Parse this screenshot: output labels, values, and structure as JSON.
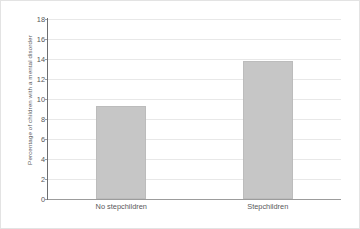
{
  "chart_data": {
    "type": "bar",
    "title": "",
    "subtitle": "",
    "xlabel": "",
    "ylabel": "Percentage of children with a mental disorder",
    "categories": [
      "No stepchildren",
      "Stepchildren"
    ],
    "values": [
      9.35,
      13.8
    ],
    "ylim": [
      0,
      18
    ],
    "ytick_labels": [
      "0",
      "2",
      "4",
      "6",
      "8",
      "10",
      "12",
      "14",
      "16",
      "18"
    ],
    "ytick_values": [
      0,
      2,
      4,
      6,
      8,
      10,
      12,
      14,
      16,
      18
    ],
    "ytick_step": 2,
    "grid": "horizontal",
    "legend": "none",
    "series": [
      {
        "name": "Percentage of children with a mental disorder",
        "values": [
          9.35,
          13.8
        ]
      }
    ],
    "colors": {
      "bar_fill": "#c6c6c6",
      "bar_border": "#bcbcbc",
      "gridline": "#e8e8e8",
      "axis_line": "#6e6e70",
      "baseline": "#9c9c9c",
      "text": "#58585a",
      "figure_border": "#e3e3e3",
      "background": "#ffffff"
    }
  }
}
